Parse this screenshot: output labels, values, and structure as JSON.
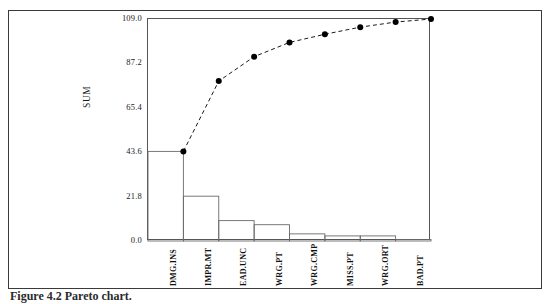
{
  "figure": {
    "caption": "Figure 4.2  Pareto chart."
  },
  "chart_data": {
    "type": "bar",
    "title": "",
    "xlabel": "",
    "ylabel": "SUM",
    "categories": [
      "DMG.INS",
      "IMPR.MT",
      "EAD.UNC",
      "WRG.PT",
      "WRG.CMP",
      "MISS.PT",
      "WRG.ORT",
      "BAD.PT"
    ],
    "values": [
      44.0,
      22.0,
      10.0,
      8.0,
      3.5,
      2.5,
      2.5,
      0.7
    ],
    "ylim": [
      0.0,
      109.0
    ],
    "ytick_labels": [
      "109.0",
      "87.2",
      "65.4",
      "43.6",
      "21.8",
      "0.0"
    ],
    "ytick_values": [
      109.0,
      87.2,
      65.4,
      43.6,
      21.8,
      0.0
    ],
    "grid": false,
    "legend": "none",
    "series": [
      {
        "name": "Frequency",
        "kind": "bar",
        "values": [
          44.0,
          22.0,
          10.0,
          8.0,
          3.5,
          2.5,
          2.5,
          0.7
        ]
      },
      {
        "name": "Cumulative",
        "kind": "line",
        "style": "dashed",
        "marker": "filled-circle",
        "values": [
          44.0,
          66.0,
          76.0,
          84.0,
          87.5,
          90.0,
          92.5,
          93.2
        ],
        "plotted_points": [
          44.0,
          78.5,
          90.5,
          97.5,
          101.5,
          105.0,
          107.5,
          109.0
        ]
      }
    ]
  },
  "axes": {
    "y_title": "SUM"
  },
  "colors": {
    "frame": "#555555",
    "outer_border": "#3a3a3a",
    "bar_stroke": "#6a6a6a",
    "line": "#1a1a1a",
    "marker": "#000000",
    "background": "#ffffff"
  }
}
